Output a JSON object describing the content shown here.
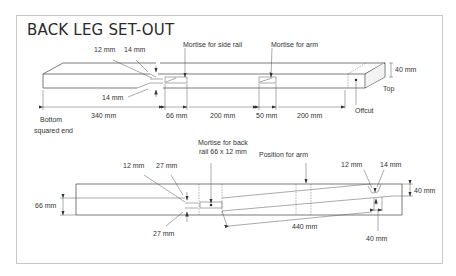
{
  "title": "BACK LEG SET-OUT",
  "upper_view": {
    "labels": {
      "dim_12": "12 mm",
      "dim_14_top": "14 mm",
      "dim_14_bottom": "14 mm",
      "mortise_side_rail": "Mortise for side rail",
      "mortise_arm": "Mortise for arm",
      "thickness": "40 mm",
      "top": "Top",
      "offcut": "Offcut",
      "bottom_end_line1": "Bottom",
      "bottom_end_line2": "squared end"
    },
    "dimensions": [
      "340 mm",
      "66 mm",
      "200 mm",
      "50 mm",
      "200 mm"
    ]
  },
  "lower_view": {
    "labels": {
      "mortise_back_rail_line1": "Mortise for back",
      "mortise_back_rail_line2": "rail 66 x 12 mm",
      "position_arm": "Position for arm",
      "dim_12_left": "12 mm",
      "dim_27_top": "27 mm",
      "dim_27_bottom": "27 mm",
      "width": "66 mm",
      "dim_12_right": "12 mm",
      "dim_14_right": "14 mm",
      "width_right": "40 mm",
      "length": "440 mm",
      "dim_40_bottom": "40 mm"
    }
  },
  "colors": {
    "line": "#444444",
    "text": "#333333",
    "frame": "#c8c8c8"
  }
}
